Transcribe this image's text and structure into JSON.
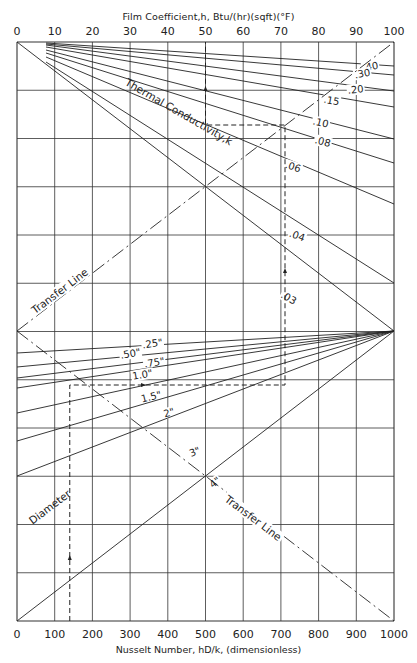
{
  "chart_data": {
    "type": "nomograph",
    "title_top": "Film Coefficient,h, Btu/(hr)(sqft)(°F)",
    "xlabel": "Nusselt Number, hD/k, (dimensionless)",
    "top_axis": {
      "label": "Film Coefficient,h, Btu/(hr)(sqft)(°F)",
      "range": [
        0,
        100
      ],
      "ticks": [
        "0",
        "10",
        "20",
        "30",
        "40",
        "50",
        "60",
        "70",
        "80",
        "90",
        "100"
      ]
    },
    "bottom_axis": {
      "label": "Nusselt Number, hD/k, (dimensionless)",
      "range": [
        0,
        1000
      ],
      "ticks": [
        "0",
        "100",
        "200",
        "300",
        "400",
        "500",
        "600",
        "700",
        "800",
        "900",
        "1000"
      ]
    },
    "grid": true,
    "thermal_conductivity": {
      "label": "Thermal Conductivity,k",
      "lines": [
        {
          "k": ".40",
          "y_right": 66
        },
        {
          "k": ".30",
          "y_right": 75
        },
        {
          "k": ".20",
          "y_right": 91
        },
        {
          "k": ".15",
          "y_right": 107
        },
        {
          "k": ".10",
          "y_right": 139
        },
        {
          "k": ".08",
          "y_right": 163
        },
        {
          "k": ".06",
          "y_right": 204
        },
        {
          "k": ".04",
          "y_right": 283
        },
        {
          "k": ".03",
          "y_right": 331
        }
      ]
    },
    "diameter": {
      "label": "Diameter",
      "lines": [
        {
          "d": ".25\"",
          "y_left": 353
        },
        {
          "d": ".50\"",
          "y_left": 367
        },
        {
          "d": ".75\"",
          "y_left": 378
        },
        {
          "d": "1.0\"",
          "y_left": 388
        },
        {
          "d": "1.5\"",
          "y_left": 413
        },
        {
          "d": "2\"",
          "y_left": 441
        },
        {
          "d": "3\"",
          "y_left": 476
        },
        {
          "d": "4\"",
          "y_left": 621
        }
      ]
    },
    "transfer_lines": [
      {
        "label": "Transfer Line",
        "from": [
          0,
          "mid"
        ],
        "to": [
          100,
          "top"
        ]
      },
      {
        "label": "Transfer Line",
        "from": [
          0,
          "mid"
        ],
        "to": [
          1000,
          "bottom"
        ]
      }
    ],
    "example_path": {
      "nusselt": 140,
      "diameter": "1.0\"",
      "k": ".10",
      "h": 50
    }
  },
  "labels": {
    "title_top": "Film Coefficient,h, Btu/(hr)(sqft)(°F)",
    "title_bottom": "Nusselt Number, hD/k, (dimensionless)"
  }
}
